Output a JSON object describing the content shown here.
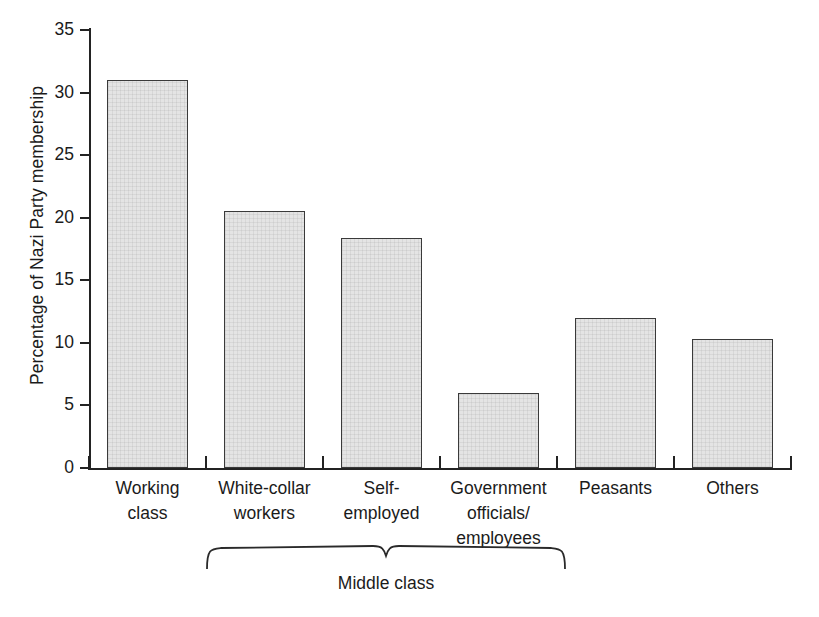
{
  "chart_data": {
    "type": "bar",
    "title": "",
    "xlabel": "",
    "ylabel": "Percentage of Nazi Party membership",
    "ylim": [
      0,
      35
    ],
    "yticks": [
      0,
      5,
      10,
      15,
      20,
      25,
      30,
      35
    ],
    "ytick_labels": [
      "0",
      "5",
      "10",
      "15",
      "20",
      "25",
      "30",
      "35"
    ],
    "grid": false,
    "legend": "none",
    "categories": [
      "Working class",
      "White-collar workers",
      "Self-employed",
      "Government officials/ employees",
      "Peasants",
      "Others"
    ],
    "category_lines": [
      [
        "Working",
        "class"
      ],
      [
        "White-collar",
        "workers"
      ],
      [
        "Self-",
        "employed"
      ],
      [
        "Government",
        "officials/",
        "employees"
      ],
      [
        "Peasants"
      ],
      [
        "Others"
      ]
    ],
    "values": [
      31.0,
      20.5,
      18.4,
      6.0,
      12.0,
      10.3
    ],
    "annotations": [
      {
        "text": "Middle class",
        "type": "brace",
        "spans_categories": [
          1,
          2,
          3
        ]
      }
    ],
    "colors": {
      "bar_fill": "#e4e4e4",
      "bar_border": "#3a3a3a",
      "axis": "#232323",
      "text": "#1b1b1b",
      "background": "#ffffff"
    }
  }
}
